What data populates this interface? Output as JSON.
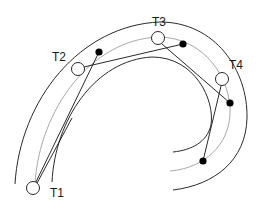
{
  "diagram": {
    "type": "curved-track-targets",
    "labels": {
      "t1": "T1",
      "t2": "T2",
      "t3": "T3",
      "t4": "T4"
    },
    "targets": [
      {
        "id": "T1",
        "x": 33,
        "y": 188,
        "label_x": 50,
        "label_y": 197
      },
      {
        "id": "T2",
        "x": 78,
        "y": 69,
        "label_x": 52,
        "label_y": 61
      },
      {
        "id": "T3",
        "x": 158,
        "y": 38,
        "label_x": 152,
        "label_y": 26
      },
      {
        "id": "T4",
        "x": 222,
        "y": 79,
        "label_x": 229,
        "label_y": 69
      }
    ],
    "filled_points": [
      {
        "x": 99,
        "y": 52
      },
      {
        "x": 183,
        "y": 44
      },
      {
        "x": 230,
        "y": 103
      },
      {
        "x": 203,
        "y": 161
      }
    ],
    "colors": {
      "stroke": "#2a2a2a",
      "middle_arc": "#a8a8a8",
      "background": "#ffffff"
    }
  }
}
